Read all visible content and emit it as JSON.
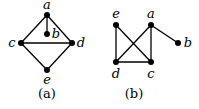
{
  "figures": [
    {
      "caption": "(a)",
      "nodes": [
        {
          "id": "a",
          "label": "a",
          "x": 47,
          "y": 15,
          "lx": 47,
          "ly": 9
        },
        {
          "id": "b",
          "label": "b",
          "x": 47,
          "y": 34,
          "lx": 56,
          "ly": 38
        },
        {
          "id": "c",
          "label": "c",
          "x": 21,
          "y": 43,
          "lx": 12,
          "ly": 47
        },
        {
          "id": "d",
          "label": "d",
          "x": 72,
          "y": 43,
          "lx": 81,
          "ly": 47
        },
        {
          "id": "e",
          "label": "e",
          "x": 47,
          "y": 70,
          "lx": 47,
          "ly": 84
        }
      ],
      "edges": [
        [
          "a",
          "b"
        ],
        [
          "a",
          "c"
        ],
        [
          "a",
          "d"
        ],
        [
          "c",
          "d"
        ],
        [
          "c",
          "e"
        ],
        [
          "d",
          "e"
        ]
      ],
      "caption_pos": {
        "x": 47,
        "y": 98
      }
    },
    {
      "caption": "(b)",
      "nodes": [
        {
          "id": "e",
          "label": "e",
          "x": 116,
          "y": 25,
          "lx": 116,
          "ly": 18
        },
        {
          "id": "a",
          "label": "a",
          "x": 151,
          "y": 25,
          "lx": 151,
          "ly": 18
        },
        {
          "id": "b",
          "label": "b",
          "x": 178,
          "y": 43,
          "lx": 188,
          "ly": 47
        },
        {
          "id": "d",
          "label": "d",
          "x": 116,
          "y": 62,
          "lx": 116,
          "ly": 78
        },
        {
          "id": "c",
          "label": "c",
          "x": 151,
          "y": 62,
          "lx": 151,
          "ly": 78
        }
      ],
      "edges": [
        [
          "e",
          "d"
        ],
        [
          "e",
          "c"
        ],
        [
          "a",
          "d"
        ],
        [
          "a",
          "c"
        ],
        [
          "a",
          "b"
        ],
        [
          "d",
          "c"
        ]
      ],
      "caption_pos": {
        "x": 134,
        "y": 98
      }
    }
  ]
}
